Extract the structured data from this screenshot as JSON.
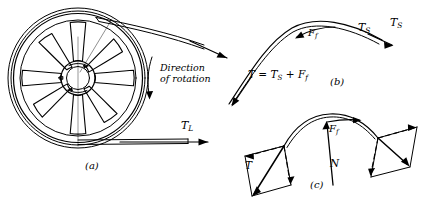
{
  "figure": {
    "background_color": "#ffffff",
    "line_color": "#000000",
    "width": 428,
    "height": 204
  },
  "panels": [
    {
      "id": "a",
      "caption": "(a)",
      "description": "Belt-driven spoked pulley with tight-side and loose-side tensions",
      "spoke_count": 8,
      "labels": [
        {
          "name": "tight-side-tension",
          "base": "T",
          "subscript": "S"
        },
        {
          "name": "load-tension",
          "base": "T",
          "subscript": "L"
        },
        {
          "name": "rotation-note",
          "line1": "Direction",
          "line2": "of rotation"
        }
      ]
    },
    {
      "id": "b",
      "caption": "(b)",
      "description": "Belt arc showing friction force adding to slack-side tension",
      "labels": [
        {
          "name": "friction-force",
          "base": "F",
          "subscript": "f"
        },
        {
          "name": "slack-side-tension",
          "base": "T",
          "subscript": "S"
        }
      ],
      "equation": {
        "name": "tension-equation",
        "terms": [
          {
            "base": "T",
            "subscript": ""
          },
          {
            "op": "="
          },
          {
            "base": "T",
            "subscript": "S"
          },
          {
            "op": "+"
          },
          {
            "base": "F",
            "subscript": "f"
          }
        ],
        "plain": "T = TS + Ff"
      }
    },
    {
      "id": "c",
      "caption": "(c)",
      "description": "Force parallelograms resolving belt tension into normal and friction components",
      "labels": [
        {
          "name": "resultant-tension",
          "base": "T",
          "subscript": ""
        },
        {
          "name": "normal-force",
          "base": "N",
          "subscript": ""
        },
        {
          "name": "friction-force",
          "base": "F",
          "subscript": "f"
        }
      ]
    }
  ],
  "icons": {
    "rotation_arrow": "curved-arrow-icon",
    "vector_arrow": "arrow-head-icon"
  }
}
